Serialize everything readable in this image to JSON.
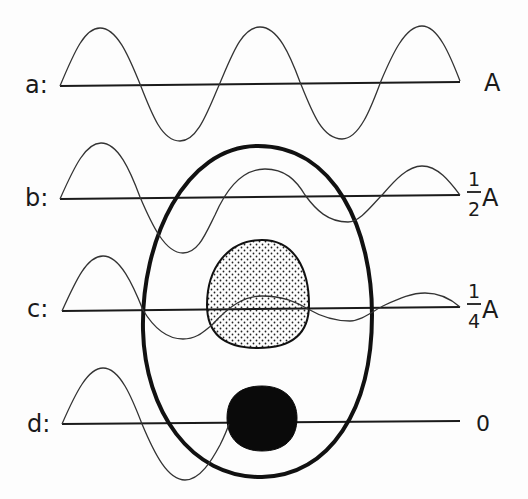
{
  "diagram": {
    "type": "wave attenuation through cell schematic",
    "rows": [
      {
        "id": "a",
        "label": "a:",
        "amplitude_label": "A",
        "fraction": null
      },
      {
        "id": "b",
        "label": "b:",
        "amplitude_label": "A",
        "fraction": {
          "numerator": "1",
          "denominator": "2"
        }
      },
      {
        "id": "c",
        "label": "c:",
        "amplitude_label": "A",
        "fraction": {
          "numerator": "1",
          "denominator": "4"
        }
      },
      {
        "id": "d",
        "label": "d:",
        "amplitude_label": "0",
        "fraction": null
      }
    ],
    "shapes": {
      "outer_oval": "cell outline",
      "stippled_region": "nucleus (stippled)",
      "black_region": "opaque body (black)"
    },
    "colors": {
      "line": "#1a1a1a",
      "background": "#fdfdfd",
      "stipple": "#222222"
    }
  }
}
